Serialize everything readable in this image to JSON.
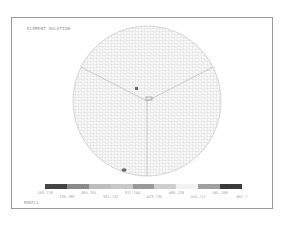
{
  "title": "ELEMENT SOLUTION",
  "footer": "MODEL1",
  "legend": {
    "colors": [
      "#444444",
      "#8a8a8a",
      "#bdbdbd",
      "#c8c8c8",
      "#9a9a9a",
      "#cfcfcf",
      "#f2f2f2",
      "#a0a0a0",
      "#3a3a3a"
    ],
    "labels_top": [
      "153.776",
      "305.761",
      "377.745",
      "469.728",
      "561.708"
    ],
    "labels_bottom": [
      "229.769",
      "331.752",
      "423.735",
      "515.717",
      "607.7"
    ]
  },
  "chart_data": {
    "type": "heatmap",
    "title": "ELEMENT SOLUTION",
    "subtitle": "MODEL1",
    "legend_values": [
      153.776,
      229.769,
      305.761,
      331.752,
      377.745,
      423.735,
      469.728,
      515.717,
      561.708,
      607.7
    ],
    "shape": "circular meshed disk contour plot"
  }
}
